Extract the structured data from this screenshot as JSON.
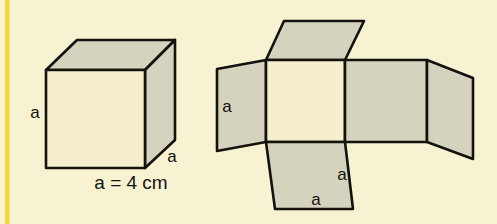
{
  "figure": {
    "background_color": "#f7f2d2",
    "accent_rule_color": "#f5d73c",
    "stroke_color": "#14120c",
    "face_light_color": "#f5efcd",
    "face_shaded_color": "#d5d3bd",
    "canvas": {
      "width": 497,
      "height": 224
    }
  },
  "cube": {
    "name": "solid-cube",
    "labels": {
      "height_label": "a",
      "depth_label": "a",
      "edge_equation": "a = 4 cm"
    },
    "faces": [
      {
        "name": "front-face",
        "shade": "light"
      },
      {
        "name": "top-face",
        "shade": "shaded"
      },
      {
        "name": "right-face",
        "shade": "shaded"
      }
    ]
  },
  "net": {
    "name": "cube-net",
    "labels": {
      "left_flap_label": "a",
      "bottom_flap_side_label": "a",
      "bottom_flap_base_label": "a"
    },
    "faces": [
      {
        "name": "net-top-flap",
        "shade": "shaded"
      },
      {
        "name": "net-left-flap",
        "shade": "shaded"
      },
      {
        "name": "net-center-face",
        "shade": "light"
      },
      {
        "name": "net-right-face",
        "shade": "shaded"
      },
      {
        "name": "net-far-right-flap",
        "shade": "shaded"
      },
      {
        "name": "net-bottom-flap",
        "shade": "shaded"
      }
    ]
  }
}
